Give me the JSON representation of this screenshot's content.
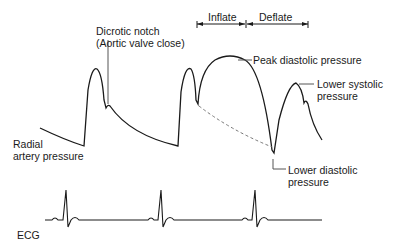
{
  "labels": {
    "dicrotic_notch_line1": "Dicrotic notch",
    "dicrotic_notch_line2": "(Aortic valve close)",
    "inflate": "Inflate",
    "deflate": "Deflate",
    "peak_diastolic": "Peak diastolic pressure",
    "lower_systolic_line1": "Lower systolic",
    "lower_systolic_line2": "pressure",
    "radial_line1": "Radial",
    "radial_line2": "artery pressure",
    "lower_diastolic_line1": "Lower diastolic",
    "lower_diastolic_line2": "pressure",
    "ecg": "ECG"
  },
  "colors": {
    "line": "#1a1a1a",
    "leader": "#555555",
    "dashed": "#777777"
  }
}
